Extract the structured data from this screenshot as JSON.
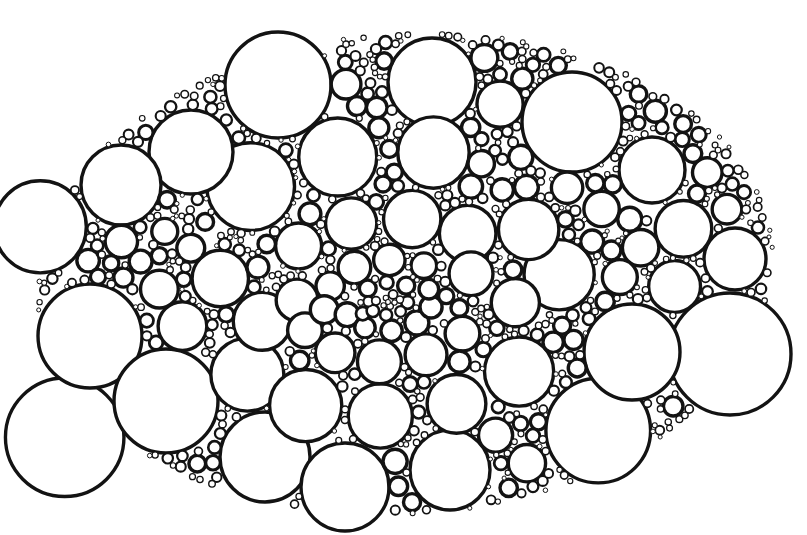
{
  "figure": {
    "background_color": "#ffffff",
    "stroke_color": "#131313",
    "fill_color": "#ffffff",
    "stroke_width": 3.4,
    "canvas": {
      "width": 807,
      "height": 535
    }
  },
  "chart_data": {
    "type": "scatter",
    "xlabel": "",
    "ylabel": "",
    "xlim": [
      0,
      807
    ],
    "ylim": [
      0,
      535
    ],
    "grid": false,
    "legend": null,
    "focus_point": {
      "x": 388,
      "y": 302
    },
    "cluster_bounds": {
      "x_min": 38,
      "x_max": 790,
      "y_min": 28,
      "y_max": 512
    },
    "cluster_ellipse": {
      "cx": 405,
      "cy": 274,
      "rx": 374,
      "ry": 244,
      "rotation_deg": -4
    },
    "ring_count": 13,
    "radius_growth_per_ring": 1.37,
    "min_radius": 2.1,
    "max_radius": 56,
    "rings": [
      {
        "index": 0,
        "count": 1,
        "radius": 2.1,
        "orbit": 0.0,
        "phase": 0
      },
      {
        "index": 1,
        "count": 6,
        "radius": 2.9,
        "orbit": 5.2,
        "phase": 14
      },
      {
        "index": 2,
        "count": 7,
        "radius": 4.0,
        "orbit": 9.6,
        "phase": 40
      },
      {
        "index": 3,
        "count": 8,
        "radius": 5.6,
        "orbit": 15.4,
        "phase": 8
      },
      {
        "index": 4,
        "count": 9,
        "radius": 7.7,
        "orbit": 23.4,
        "phase": 30
      },
      {
        "index": 5,
        "count": 10,
        "radius": 10.6,
        "orbit": 34.6,
        "phase": 52
      },
      {
        "index": 6,
        "count": 11,
        "radius": 14.4,
        "orbit": 50.2,
        "phase": 12
      },
      {
        "index": 7,
        "count": 12,
        "radius": 19.3,
        "orbit": 71.4,
        "phase": 38
      },
      {
        "index": 8,
        "count": 13,
        "radius": 25.4,
        "orbit": 99.8,
        "phase": 62
      },
      {
        "index": 9,
        "count": 14,
        "radius": 32.3,
        "orbit": 136.0,
        "phase": 18
      },
      {
        "index": 10,
        "count": 15,
        "radius": 39.5,
        "orbit": 180.0,
        "phase": 44
      },
      {
        "index": 11,
        "count": 16,
        "radius": 46.5,
        "orbit": 232.0,
        "phase": 70
      },
      {
        "index": 12,
        "count": 14,
        "radius": 52.5,
        "orbit": 292.0,
        "phase": 24
      }
    ],
    "anchor_circles": [
      {
        "name": "top-large-left",
        "x": 278,
        "y": 85,
        "r": 53
      },
      {
        "name": "top-large-right",
        "x": 432,
        "y": 82,
        "r": 44
      },
      {
        "name": "top-right-large",
        "x": 572,
        "y": 122,
        "r": 50
      },
      {
        "name": "upper-left-medium",
        "x": 121,
        "y": 185,
        "r": 40
      },
      {
        "name": "upper-left-large",
        "x": 191,
        "y": 152,
        "r": 42
      },
      {
        "name": "left-medium",
        "x": 115,
        "y": 268,
        "r": 40
      },
      {
        "name": "left-outer-large",
        "x": 90,
        "y": 336,
        "r": 52
      },
      {
        "name": "lower-left-large",
        "x": 166,
        "y": 401,
        "r": 52
      },
      {
        "name": "bottom-left-medium",
        "x": 265,
        "y": 457,
        "r": 45
      },
      {
        "name": "bottom-center-large",
        "x": 345,
        "y": 487,
        "r": 44
      },
      {
        "name": "bottom-right-medium",
        "x": 450,
        "y": 470,
        "r": 40
      },
      {
        "name": "right-lower-large",
        "x": 632,
        "y": 352,
        "r": 48
      },
      {
        "name": "right-outer-large",
        "x": 730,
        "y": 354,
        "r": 61
      },
      {
        "name": "right-upper-large",
        "x": 678,
        "y": 252,
        "r": 52
      },
      {
        "name": "far-right-small",
        "x": 735,
        "y": 259,
        "r": 31
      },
      {
        "name": "top-right-small",
        "x": 652,
        "y": 170,
        "r": 33
      }
    ]
  }
}
